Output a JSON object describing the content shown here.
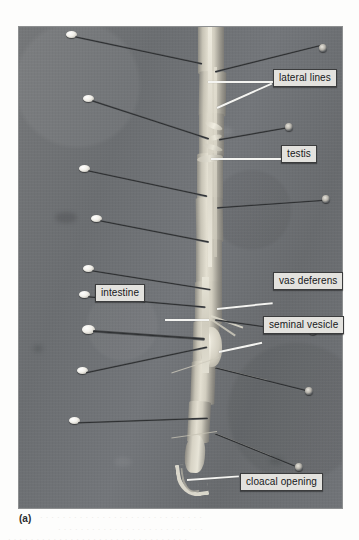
{
  "figure": {
    "caption": "(a)",
    "kind": "anatomical-dissection-photograph",
    "background_color": "#6e7174",
    "label_box_color": "#e3e2de",
    "leader_line_color": "#f4f4f1"
  },
  "labels": [
    {
      "id": "lateral-lines",
      "text": "lateral lines"
    },
    {
      "id": "testis",
      "text": "testis"
    },
    {
      "id": "vas-deferens",
      "text": "vas deferens"
    },
    {
      "id": "intestine",
      "text": "intestine"
    },
    {
      "id": "seminal-vesicle",
      "text": "seminal vesicle"
    },
    {
      "id": "cloacal-opening",
      "text": "cloacal opening"
    }
  ],
  "bleed_through": {
    "line1": "· · · ·   · · · · ·   · ·   · · · ·   · · · · · · ·   · · ·   · · · ·",
    "line2": "· ·   · · ·   · · · ·   · · · · ·   · · ·   · · · · ·   · · · ·",
    "line3": "· · ·   · · · · ·   · · ·   · · · ·   · · · · ·   · · ·   · · · · · ·   · · ·"
  }
}
